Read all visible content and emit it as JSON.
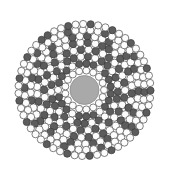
{
  "figure": {
    "type": "radial-circle-packing",
    "canvas": {
      "width": 169,
      "height": 175,
      "background": "#ffffff"
    },
    "center": {
      "x": 84.5,
      "y": 90.0
    },
    "outer_radius": 71,
    "palette": {
      "background": "#ffffff",
      "circle_fill_light": "#fcfcfc",
      "circle_stroke": "#4a4a4a",
      "circle_fill_dark": "#5c5c5c",
      "circle_stroke_dark": "#3a3a3a",
      "hub_fill": "#a9a9a9",
      "hub_stroke": "#8d8d8d"
    },
    "hub": {
      "label": "center-disk",
      "radius": 14.5,
      "fill": "#a9a9a9"
    },
    "ring_count": 10,
    "rings": [
      {
        "index": 0,
        "radius": 19.5,
        "count": 17,
        "dot_radius": 3.5,
        "phase_deg": 0,
        "dark_indices": []
      },
      {
        "index": 1,
        "radius": 26.5,
        "count": 23,
        "dot_radius": 3.6,
        "phase_deg": 8,
        "dark_indices": []
      },
      {
        "index": 2,
        "radius": 33.5,
        "count": 29,
        "dot_radius": 3.7,
        "phase_deg": 3,
        "dark_indices": []
      },
      {
        "index": 3,
        "radius": 40.5,
        "count": 34,
        "dot_radius": 3.8,
        "phase_deg": 11,
        "dark_indices": [
          0,
          2,
          4,
          6,
          8,
          10,
          12,
          14,
          16,
          18,
          20,
          22,
          24,
          26,
          28,
          30,
          32
        ]
      },
      {
        "index": 4,
        "radius": 47.5,
        "count": 40,
        "dot_radius": 3.8,
        "phase_deg": 4,
        "dark_indices": []
      },
      {
        "index": 5,
        "radius": 54.0,
        "count": 45,
        "dot_radius": 3.8,
        "phase_deg": 9,
        "dark_indices": []
      },
      {
        "index": 6,
        "radius": 60.0,
        "count": 50,
        "dot_radius": 3.7,
        "phase_deg": 2,
        "dark_indices": [
          0,
          5,
          10,
          15,
          20,
          25,
          30,
          35,
          40,
          45
        ]
      },
      {
        "index": 7,
        "radius": 66.0,
        "count": 55,
        "dot_radius": 3.6,
        "phase_deg": 7,
        "dark_indices": []
      }
    ],
    "spokes": {
      "label": "radial-dark-spokes",
      "arm_count": 17,
      "base_angle_deg": 0,
      "arm_dark_rings": [
        1,
        2,
        4,
        5,
        7
      ]
    },
    "annotations": {
      "visible_text": [],
      "axes": false,
      "legend": false,
      "gridlines": false
    }
  }
}
